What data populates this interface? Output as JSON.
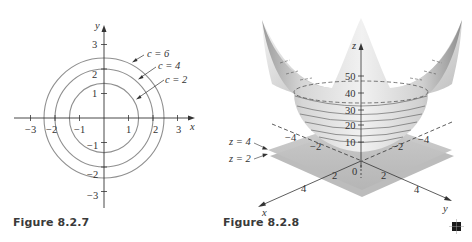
{
  "figures": [
    {
      "caption": "Figure 8.2.7",
      "type": "level-curves",
      "axes": {
        "x_label": "x",
        "y_label": "y",
        "x_ticks": [
          "−3",
          "−2",
          "−1",
          "1",
          "2",
          "3"
        ],
        "y_ticks": [
          "3",
          "2",
          "1",
          "−1",
          "−2",
          "−3"
        ]
      },
      "curves": [
        {
          "label": "c = 6",
          "radius": 2.449
        },
        {
          "label": "c = 4",
          "radius": 2.0
        },
        {
          "label": "c = 2",
          "radius": 1.414
        }
      ]
    },
    {
      "caption": "Figure 8.2.8",
      "type": "surface-3d",
      "axes": {
        "x_label": "x",
        "y_label": "y",
        "z_label": "z",
        "z_ticks": [
          "50",
          "40",
          "30",
          "20",
          "10"
        ],
        "x_ticks": [
          "2",
          "4",
          "−2",
          "−4"
        ],
        "y_ticks": [
          "2",
          "4",
          "−2",
          "−4"
        ],
        "origin": "0"
      },
      "planes": [
        {
          "label": "z = 4"
        },
        {
          "label": "z = 2"
        }
      ]
    }
  ],
  "end_marker": "■",
  "colors": {
    "curve": "#8a8a8a",
    "axis": "#333333",
    "plane": "#c8c8c8",
    "surface": "#e4e4e4"
  }
}
